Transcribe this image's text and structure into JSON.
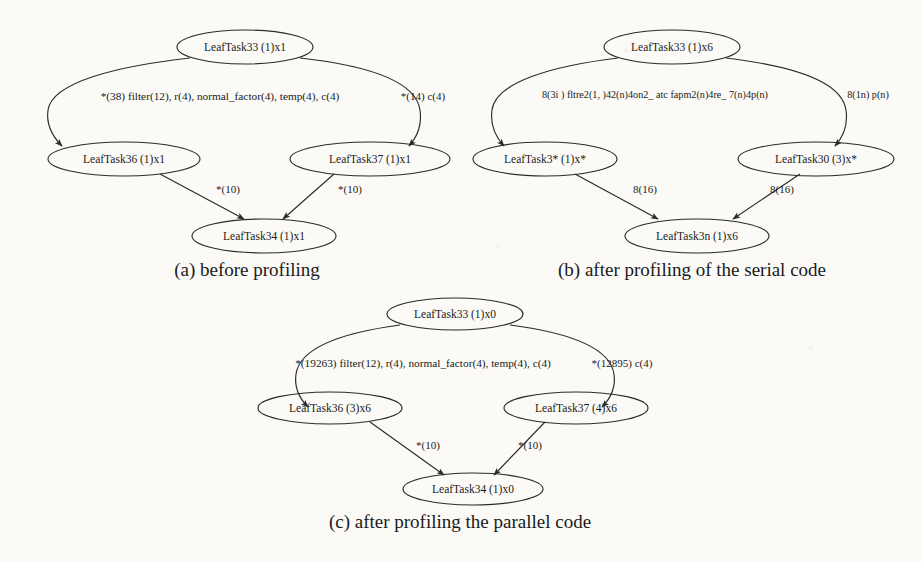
{
  "figure": {
    "background_color": "#fbfaf7",
    "ink_color": "#1a1a1a"
  },
  "panels": [
    {
      "id": "a",
      "caption": "(a) before profiling",
      "nodes": {
        "root": "LeafTask33 (1)x1",
        "left": "LeafTask36 (1)x1",
        "right": "LeafTask37 (1)x1",
        "bottom": "LeafTask34 (1)x1"
      },
      "edges": {
        "root_left": "*(38) filter(12), r(4), normal_factor(4), temp(4), c(4)",
        "root_right": "*(14) c(4)",
        "left_bottom": "*(10)",
        "right_bottom": "*(10)"
      }
    },
    {
      "id": "b",
      "caption": "(b) after profiling of the serial code",
      "nodes": {
        "root": "LeafTask33 (1)x6",
        "left": "LeafTask3* (1)x*",
        "right": "LeafTask30 (3)x*",
        "bottom": "LeafTask3n (1)x6"
      },
      "edges": {
        "root_left": "8(3i ) fltre2(1, )42(n)4on2_ atc fapm2(n)4re_ 7(n)4p(n)",
        "root_right": "8(1n) p(n)",
        "left_bottom": "8(16)",
        "right_bottom": "8(16)"
      }
    },
    {
      "id": "c",
      "caption": "(c) after profiling the parallel code",
      "nodes": {
        "root": "LeafTask33 (1)x0",
        "left": "LeafTask36 (3)x6",
        "right": "LeafTask37 (4)x6",
        "bottom": "LeafTask34 (1)x0"
      },
      "edges": {
        "root_left": "*(19263) filter(12), r(4), normal_factor(4), temp(4), c(4)",
        "root_right": "*(12895) c(4)",
        "left_bottom": "*(10)",
        "right_bottom": "*(10)"
      }
    }
  ]
}
